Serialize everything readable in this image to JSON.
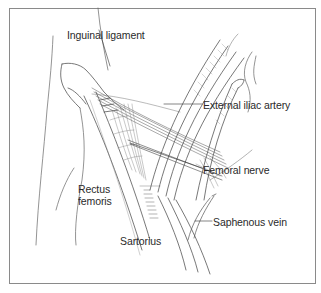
{
  "figure": {
    "type": "anatomical-line-illustration",
    "region": "femoral triangle / inguinal region",
    "border_color": "#8a8a8a",
    "line_color": "#555555",
    "label_color": "#2a2a2a"
  },
  "labels": {
    "inguinal_ligament": "Inguinal ligament",
    "external_iliac_artery": "External iliac artery",
    "femoral_nerve": "Femoral nerve",
    "rectus_femoris_line1": "Rectus",
    "rectus_femoris_line2": "femoris",
    "sartorius": "Sartorius",
    "saphenous_vein": "Saphenous vein"
  }
}
